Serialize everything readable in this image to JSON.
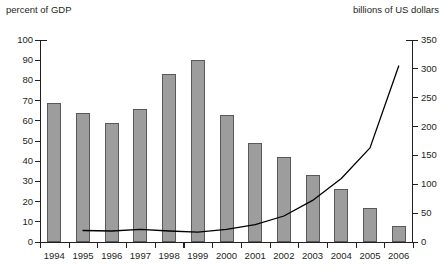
{
  "captions": {
    "left": "percent of GDP",
    "right": "billions of US dollars"
  },
  "chart_data": {
    "type": "bar",
    "title": "",
    "xlabel": "",
    "ylabel": "percent of GDP",
    "y2label": "billions of US dollars",
    "grid": false,
    "legend": "none",
    "categories": [
      "1994",
      "1995",
      "1996",
      "1997",
      "1998",
      "1999",
      "2000",
      "2001",
      "2002",
      "2003",
      "2004",
      "2005",
      "2006"
    ],
    "ylim": [
      0,
      100
    ],
    "yticks": [
      0,
      10,
      20,
      30,
      40,
      50,
      60,
      70,
      80,
      90,
      100
    ],
    "y2lim": [
      0,
      350
    ],
    "y2ticks": [
      0,
      50,
      100,
      150,
      200,
      250,
      300,
      350
    ],
    "series": [
      {
        "name": "percent of GDP",
        "type": "bar",
        "axis": "left",
        "color": "#9d9d9d",
        "edge_color": "#58595b",
        "values": [
          69,
          64,
          59,
          66,
          83,
          90,
          63,
          49,
          42,
          33,
          26,
          17,
          8
        ]
      },
      {
        "name": "billions of US dollars",
        "type": "line",
        "axis": "right",
        "color": "#000000",
        "x": [
          "1995",
          "1996",
          "1997",
          "1998",
          "1999",
          "2000",
          "2001",
          "2002",
          "2003",
          "2004",
          "2005",
          "2006"
        ],
        "values": [
          20,
          19,
          22,
          19,
          17,
          22,
          30,
          45,
          72,
          110,
          163,
          305
        ]
      }
    ]
  }
}
